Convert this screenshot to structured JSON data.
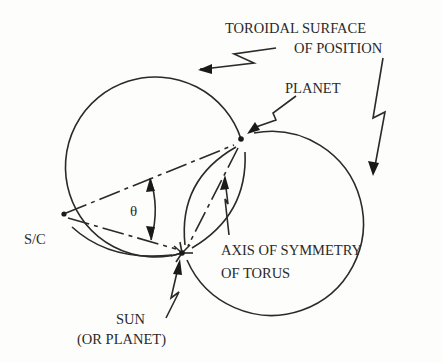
{
  "diagram": {
    "labels": {
      "toroidal_line1": "TOROIDAL SURFACE",
      "toroidal_line2": "OF POSITION",
      "planet": "PLANET",
      "sc": "S/C",
      "theta": "θ",
      "axis_line1": "AXIS OF SYMMETRY",
      "axis_line2": "OF TORUS",
      "sun_line1": "SUN",
      "sun_line2": "(OR PLANET)"
    },
    "points": [
      "S/C",
      "PLANET",
      "SUN"
    ],
    "colors": {
      "ink": "#2a2a2a",
      "background": "#fdfdfb"
    }
  }
}
